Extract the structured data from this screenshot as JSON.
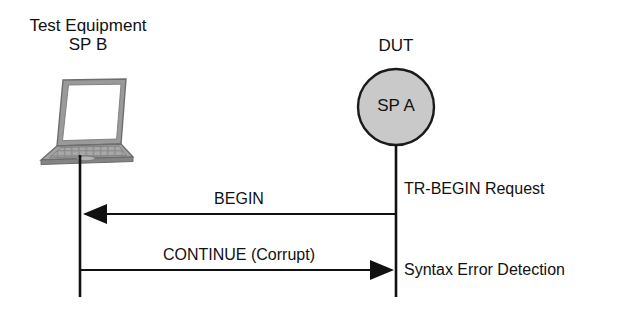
{
  "diagram": {
    "type": "message-sequence-chart",
    "background_color": "#ffffff",
    "line_color": "#111111",
    "actors": {
      "left": {
        "caption_line1": "Test Equipment",
        "caption_line2": "SP B",
        "icon": "laptop-icon",
        "lifeline_x": 80,
        "lifeline_top": 152,
        "lifeline_bottom": 297
      },
      "right": {
        "caption": "DUT",
        "node_label": "SP A",
        "node_shape": "circle",
        "node_fill": "#c9c9c9",
        "node_stroke": "#1a1a1a",
        "lifeline_x": 396,
        "lifeline_top": 146,
        "lifeline_bottom": 297
      }
    },
    "messages": [
      {
        "label": "BEGIN",
        "direction": "right-to-left",
        "from": "DUT",
        "to": "Test Equipment",
        "y": 214
      },
      {
        "label": "CONTINUE (Corrupt)",
        "direction": "left-to-right",
        "from": "Test Equipment",
        "to": "DUT",
        "y": 270
      }
    ],
    "annotations": [
      {
        "text": "TR-BEGIN Request",
        "y": 180,
        "side": "right"
      },
      {
        "text": "Syntax Error Detection",
        "y": 261,
        "side": "right"
      }
    ]
  }
}
